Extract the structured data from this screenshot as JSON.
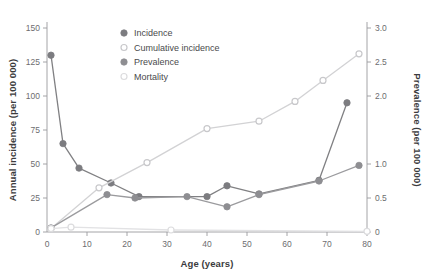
{
  "chart_data": {
    "type": "line",
    "title": "",
    "xlabel": "Age (years)",
    "ylabel": "Annual incidence (per 100 000)",
    "y2label": "Prevalence (per 100 000)",
    "xlim": [
      0,
      80
    ],
    "ylim": [
      0,
      150
    ],
    "y2lim": [
      0,
      3.0
    ],
    "grid": false,
    "legend_position": "upper-center",
    "xticks": [
      0,
      10,
      20,
      30,
      40,
      50,
      60,
      70,
      80
    ],
    "xtick_labels": [
      "0",
      "10",
      "20",
      "30",
      "40",
      "50",
      "60",
      "70",
      "80"
    ],
    "yticks": [
      0,
      25,
      50,
      75,
      100,
      125,
      150
    ],
    "ytick_labels": [
      "0",
      "25",
      "50",
      "75",
      "100",
      "125",
      "150"
    ],
    "y2ticks": [
      0,
      0.5,
      1.0,
      2.0,
      2.5,
      3.0
    ],
    "y2tick_labels": [
      "0",
      "0.5",
      "1.0",
      "2.0",
      "2.5",
      "3.0"
    ],
    "series": [
      {
        "name": "Incidence",
        "axis": "left",
        "color": "#808083",
        "marker": "filled-circle",
        "marker_color": "#7c7c80",
        "x": [
          1,
          4,
          8,
          16,
          23,
          40,
          45,
          53,
          68,
          75
        ],
        "values": [
          130,
          65,
          47,
          36,
          26,
          26,
          34,
          28,
          38,
          95
        ]
      },
      {
        "name": "Cumulative incidence",
        "axis": "right",
        "color": "#d2d2d4",
        "marker": "open-circle",
        "marker_color": "#c8c8cb",
        "x": [
          1,
          13,
          25,
          40,
          53,
          62,
          69,
          78
        ],
        "values": [
          0.05,
          0.65,
          1.02,
          1.52,
          1.63,
          1.92,
          2.23,
          2.62
        ]
      },
      {
        "name": "Prevalence",
        "axis": "right",
        "color": "#9b9b9e",
        "marker": "filled-circle",
        "marker_color": "#8e8e92",
        "x": [
          1,
          15,
          22,
          35,
          45,
          53,
          68,
          78
        ],
        "values": [
          0.06,
          0.55,
          0.5,
          0.52,
          0.37,
          0.55,
          0.75,
          0.98
        ]
      },
      {
        "name": "Mortality",
        "axis": "left",
        "color": "#e2e2e4",
        "marker": "open-circle",
        "marker_color": "#dcdcde",
        "x": [
          1,
          6,
          31,
          80
        ],
        "values": [
          2.5,
          3.5,
          1.5,
          0.5
        ]
      }
    ]
  },
  "legend": {
    "items": [
      {
        "label": "Incidence"
      },
      {
        "label": "Cumulative incidence"
      },
      {
        "label": "Prevalence"
      },
      {
        "label": "Mortality"
      }
    ]
  }
}
